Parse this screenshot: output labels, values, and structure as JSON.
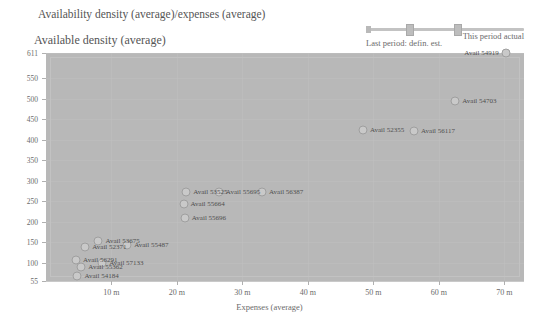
{
  "header": {
    "title": "Availability density (average)/expenses (average)",
    "subtitle": "Available density (average)",
    "slider": {
      "label_top_right": "This period actual",
      "label_bottom_left": "Last period: defin. est."
    }
  },
  "chart_data": {
    "type": "scatter",
    "title": "Availability density (average)/expenses (average)",
    "subtitle": "Available density (average)",
    "xlabel": "Expenses (average)",
    "ylabel": "Available density (average)",
    "xlim": [
      0,
      73
    ],
    "ylim": [
      55,
      611
    ],
    "grid": true,
    "legend": "none",
    "xticks": [
      {
        "value": 10,
        "label": "10 m"
      },
      {
        "value": 20,
        "label": "20 m"
      },
      {
        "value": 30,
        "label": "30 m"
      },
      {
        "value": 40,
        "label": "40 m"
      },
      {
        "value": 50,
        "label": "50 m"
      },
      {
        "value": 60,
        "label": "60 m"
      },
      {
        "value": 70,
        "label": "70 m"
      }
    ],
    "yticks": [
      {
        "value": 611,
        "label": "611"
      },
      {
        "value": 550,
        "label": "550"
      },
      {
        "value": 500,
        "label": "500"
      },
      {
        "value": 450,
        "label": "450"
      },
      {
        "value": 400,
        "label": "400"
      },
      {
        "value": 350,
        "label": "350"
      },
      {
        "value": 300,
        "label": "300"
      },
      {
        "value": 250,
        "label": "250"
      },
      {
        "value": 200,
        "label": "200"
      },
      {
        "value": 150,
        "label": "150"
      },
      {
        "value": 100,
        "label": "100"
      },
      {
        "value": 55,
        "label": "55"
      }
    ],
    "points": [
      {
        "label": "Avail 54919",
        "x": 70.2,
        "y": 611,
        "label_side": "left"
      },
      {
        "label": "Avail 54703",
        "x": 62.5,
        "y": 493,
        "label_side": "right"
      },
      {
        "label": "Avail 56117",
        "x": 56.2,
        "y": 422,
        "label_side": "right"
      },
      {
        "label": "Avail 52355",
        "x": 48.4,
        "y": 424,
        "label_side": "right"
      },
      {
        "label": "Avail 56387",
        "x": 33.0,
        "y": 272,
        "label_side": "right"
      },
      {
        "label": "Avail 55695",
        "x": 26.4,
        "y": 272,
        "label_side": "right"
      },
      {
        "label": "Avail 53525",
        "x": 21.4,
        "y": 272,
        "label_side": "right"
      },
      {
        "label": "Avail 55664",
        "x": 21.0,
        "y": 243,
        "label_side": "right"
      },
      {
        "label": "Avail 55696",
        "x": 21.2,
        "y": 209,
        "label_side": "right"
      },
      {
        "label": "Avail 55487",
        "x": 12.4,
        "y": 143,
        "label_side": "right"
      },
      {
        "label": "Avail 53675",
        "x": 8.0,
        "y": 152,
        "label_side": "right"
      },
      {
        "label": "Avail 52371",
        "x": 6.0,
        "y": 139,
        "label_side": "right"
      },
      {
        "label": "Avail 57133",
        "x": 8.6,
        "y": 100,
        "label_side": "right"
      },
      {
        "label": "Avail 56291",
        "x": 4.6,
        "y": 106,
        "label_side": "right"
      },
      {
        "label": "Avail 55362",
        "x": 5.4,
        "y": 88,
        "label_side": "right"
      },
      {
        "label": "Avail 54184",
        "x": 4.8,
        "y": 68,
        "label_side": "right"
      }
    ]
  },
  "colors": {
    "plot_background": "#b8b8b8",
    "page_background": "#ffffff",
    "marker_fill": "#c9c9c9",
    "marker_stroke": "#9f9f9f",
    "text": "#4f4f4f",
    "axis_text": "#6b6b6b"
  }
}
